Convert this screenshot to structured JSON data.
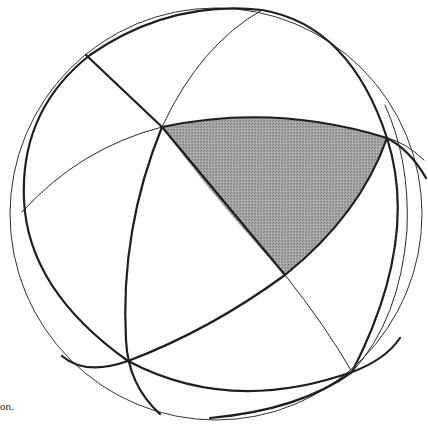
{
  "figure": {
    "caption_fragment": "on.",
    "colors": {
      "background": "#ffffff",
      "line": "#1e1e1e",
      "triangle_fill": "#9a9a9a"
    },
    "sphere": {
      "cx": 216,
      "cy": 213,
      "r": 206
    },
    "vertices": {
      "A": [
        162,
        127
      ],
      "B": [
        387,
        138
      ],
      "C": [
        285,
        275
      ],
      "D": [
        128,
        361
      ],
      "E": [
        352,
        372
      ]
    },
    "shaded_region": "spherical triangle ABC"
  }
}
